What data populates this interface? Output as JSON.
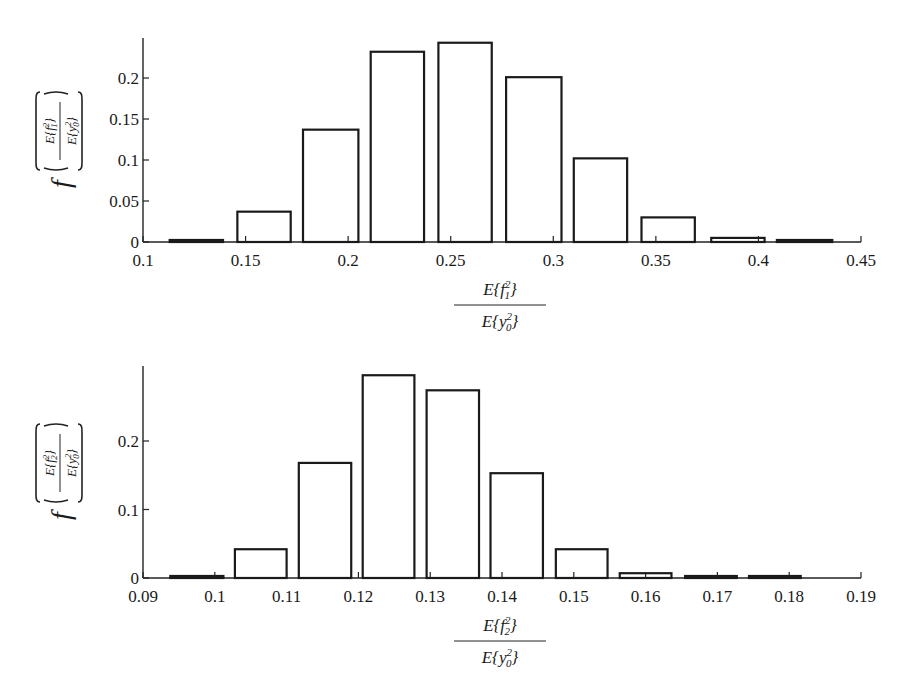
{
  "chart_data": [
    {
      "type": "bar",
      "title": "",
      "xlabel": "E{f1^2} / E{y0^2}",
      "ylabel": "f( E{f1^2} / E{y0^2} )",
      "xlabel_parts": {
        "num_base": "E{f",
        "num_sup": "2",
        "num_sub": "1",
        "den_base": "E{y",
        "den_sup": "2",
        "den_sub": "0"
      },
      "ylabel_prefix": "f",
      "xlim": [
        0.1,
        0.45
      ],
      "ylim": [
        0,
        0.25
      ],
      "x_ticks": [
        "0.1",
        "0.15",
        "0.2",
        "0.25",
        "0.3",
        "0.35",
        "0.4",
        "0.45"
      ],
      "y_ticks": [
        "0",
        "0.05",
        "0.1",
        "0.15",
        "0.2"
      ],
      "bin_edges": [
        0.113,
        0.139,
        0.146,
        0.172,
        0.178,
        0.205,
        0.211,
        0.237,
        0.244,
        0.27,
        0.277,
        0.304,
        0.31,
        0.336,
        0.343,
        0.369,
        0.377,
        0.403,
        0.409,
        0.436
      ],
      "categories": [
        "0.126",
        "0.159",
        "0.192",
        "0.224",
        "0.257",
        "0.290",
        "0.323",
        "0.356",
        "0.390",
        "0.423"
      ],
      "values": [
        0.002,
        0.037,
        0.137,
        0.232,
        0.243,
        0.201,
        0.102,
        0.03,
        0.005,
        0.001
      ],
      "grid": false,
      "legend": null
    },
    {
      "type": "bar",
      "title": "",
      "xlabel": "E{f2^2} / E{y0^2}",
      "ylabel": "f( E{f2^2} / E{y0^2} )",
      "xlabel_parts": {
        "num_base": "E{f",
        "num_sup": "2",
        "num_sub": "2",
        "den_base": "E{y",
        "den_sup": "2",
        "den_sub": "0"
      },
      "ylabel_prefix": "f",
      "xlim": [
        0.09,
        0.19
      ],
      "ylim": [
        0,
        0.3
      ],
      "x_ticks": [
        "0.09",
        "0.1",
        "0.11",
        "0.12",
        "0.13",
        "0.14",
        "0.15",
        "0.16",
        "0.17",
        "0.18",
        "0.19"
      ],
      "y_ticks": [
        "0",
        "0.1",
        "0.2"
      ],
      "bin_edges": [
        0.0938,
        0.1012,
        0.1028,
        0.11,
        0.1117,
        0.119,
        0.1206,
        0.1278,
        0.1295,
        0.1368,
        0.1384,
        0.1457,
        0.1475,
        0.1547,
        0.1564,
        0.1636,
        0.1655,
        0.1727,
        0.1744,
        0.1816
      ],
      "categories": [
        "0.0975",
        "0.1064",
        "0.1153",
        "0.1242",
        "0.1331",
        "0.1420",
        "0.1511",
        "0.1600",
        "0.1691",
        "0.1780"
      ],
      "values": [
        0.002,
        0.042,
        0.168,
        0.296,
        0.274,
        0.153,
        0.042,
        0.007,
        0.001,
        0.0005
      ],
      "grid": false,
      "legend": null
    }
  ]
}
